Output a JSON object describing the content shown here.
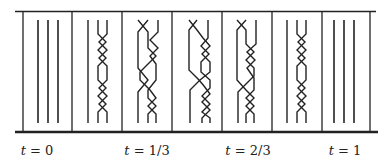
{
  "diagram": {
    "type": "braid-homotopy",
    "frame": {
      "color": "#222222",
      "panels": 7
    },
    "panels": [
      {
        "id": "p1",
        "kind": "trivial",
        "strands": 3
      },
      {
        "id": "p2",
        "kind": "braid",
        "description": "strand 1 straight; strands 2-3 twist 3 times, separate, twist 3 times"
      },
      {
        "id": "p3",
        "kind": "braid",
        "description": "crossing of strands 1-2 then triple twist of 2-3, repeated"
      },
      {
        "id": "p4",
        "kind": "braid",
        "description": "crossing of strands 1-2 then triple twist of 2-3, repeated"
      },
      {
        "id": "p5",
        "kind": "braid",
        "description": "crossing of strands 1-2 then triple twist of 2-3, repeated"
      },
      {
        "id": "p6",
        "kind": "braid",
        "description": "strand 1 straight; strands 2-3 twist 3 times, separate, twist 3 times"
      },
      {
        "id": "p7",
        "kind": "trivial",
        "strands": 3
      }
    ],
    "labels": [
      {
        "var": "t",
        "value": "0",
        "x": 37
      },
      {
        "var": "t",
        "value": "1/3",
        "x": 147
      },
      {
        "var": "t",
        "value": "2/3",
        "x": 248
      },
      {
        "var": "t",
        "value": "1",
        "x": 345
      }
    ]
  }
}
